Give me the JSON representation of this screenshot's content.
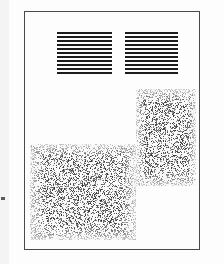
{
  "page": {
    "width": 224,
    "height": 264,
    "background_color": "#ffffff",
    "paper_color": "#fdfdfd"
  },
  "frame": {
    "name": "document-border-frame",
    "x": 24,
    "y": 11,
    "width": 176,
    "height": 239,
    "border_width": 1,
    "border_color": "#4a4a4a"
  },
  "line_blocks": [
    {
      "name": "left-line-pattern",
      "label": "left resolution bar pattern",
      "x": 57,
      "y": 32,
      "width": 55,
      "height": 45,
      "line_count": 11,
      "line_thickness": 2,
      "line_gap": 2,
      "line_color": "#1c1c1c"
    },
    {
      "name": "right-line-pattern",
      "label": "right resolution bar pattern",
      "x": 125,
      "y": 32,
      "width": 53,
      "height": 45,
      "line_count": 11,
      "line_thickness": 2,
      "line_gap": 2,
      "line_color": "#1c1c1c"
    }
  ],
  "noise_patches": [
    {
      "name": "right-halftone-patch",
      "label": "upper right dither patch",
      "x": 136,
      "y": 89,
      "width": 60,
      "height": 97,
      "density": 0.34,
      "dot_color": "#2e2e2e",
      "background_color": "#ffffff",
      "seed": 1357
    },
    {
      "name": "left-halftone-patch",
      "label": "lower left dither patch",
      "x": 30,
      "y": 144,
      "width": 106,
      "height": 96,
      "density": 0.34,
      "dot_color": "#2e2e2e",
      "background_color": "#ffffff",
      "seed": 2468
    }
  ],
  "marks": [
    {
      "name": "left-edge-registration-mark",
      "label": "registration tick",
      "x": 1,
      "y": 197,
      "width": 4,
      "height": 3,
      "color": "#5a5a5a"
    }
  ],
  "scan_band": {
    "name": "left-scan-band",
    "x": 0,
    "y": 0,
    "width": 9,
    "height": 264,
    "color": "#f4f4f4"
  }
}
